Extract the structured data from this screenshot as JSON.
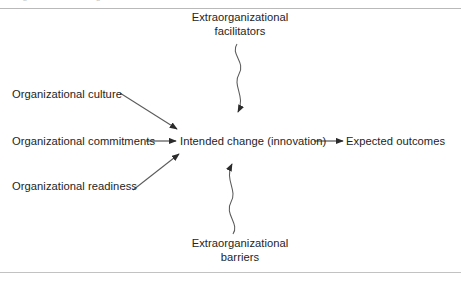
{
  "figure": {
    "title_clipped": "organizational change",
    "rules": {
      "top": "divider-line",
      "bottom": "divider-line"
    }
  },
  "nodes": {
    "facilitators": {
      "line1": "Extraorganizational",
      "line2": "facilitators"
    },
    "barriers": {
      "line1": "Extraorganizational",
      "line2": "barriers"
    },
    "culture": {
      "label": "Organizational culture"
    },
    "commitments": {
      "label": "Organizational commitments"
    },
    "readiness": {
      "label": "Organizational readiness"
    },
    "intended_change": {
      "label": "Intended change (innovation)"
    },
    "expected_outcomes": {
      "label": "Expected outcomes"
    }
  },
  "edges": [
    {
      "id": "facilitators-to-change",
      "from": "facilitators",
      "to": "intended_change",
      "style": "wavy",
      "direction": "down"
    },
    {
      "id": "barriers-to-change",
      "from": "barriers",
      "to": "intended_change",
      "style": "wavy",
      "direction": "up"
    },
    {
      "id": "culture-to-change",
      "from": "culture",
      "to": "intended_change",
      "style": "straight",
      "direction": "diagonal-down-right"
    },
    {
      "id": "commitments-to-change",
      "from": "commitments",
      "to": "intended_change",
      "style": "straight",
      "direction": "right"
    },
    {
      "id": "readiness-to-change",
      "from": "readiness",
      "to": "intended_change",
      "style": "straight",
      "direction": "diagonal-up-right"
    },
    {
      "id": "change-to-outcomes",
      "from": "intended_change",
      "to": "expected_outcomes",
      "style": "straight",
      "direction": "right"
    }
  ],
  "colors": {
    "text": "#242424",
    "line": "#4a4a4a",
    "rule": "#b9b9b9",
    "background": "#ffffff"
  }
}
